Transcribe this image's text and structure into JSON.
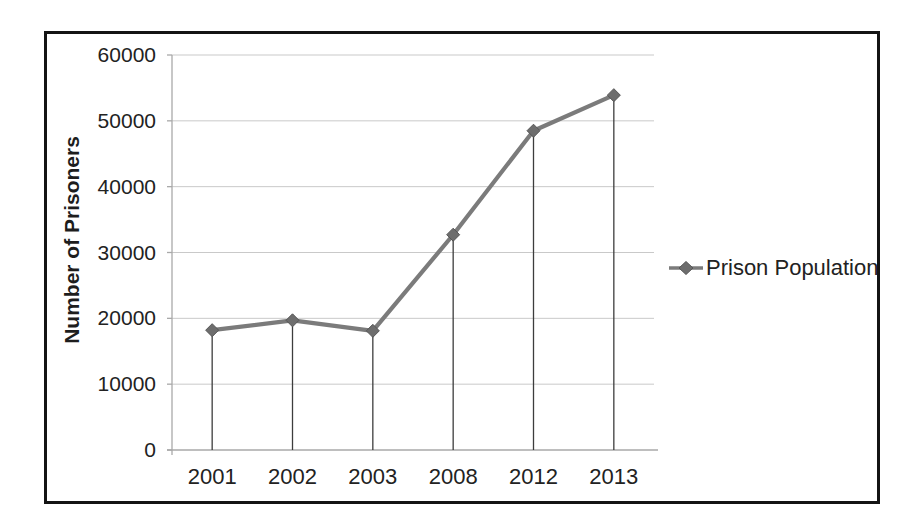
{
  "window": {
    "background": "#ffffff",
    "frame_border_color": "#141414",
    "text_color": "#222222"
  },
  "chart_data": {
    "type": "line",
    "title": "",
    "xlabel": "",
    "ylabel": "Number of Prisoners",
    "categories": [
      "2001",
      "2002",
      "2003",
      "2008",
      "2012",
      "2013"
    ],
    "series": [
      {
        "name": "Prison Population",
        "values": [
          18200,
          19700,
          18100,
          32700,
          48500,
          53900
        ],
        "color": "#7b7b7b",
        "marker": "diamond",
        "marker_color": "#6d6d6d",
        "marker_edge_color": "#565656"
      }
    ],
    "ylim": [
      0,
      60000
    ],
    "ytick_step": 10000,
    "yticks": [
      0,
      10000,
      20000,
      30000,
      40000,
      50000,
      60000
    ],
    "grid": "horizontal-major",
    "gridline_color": "#c9c9c9",
    "axis_color": "#a9a9a9",
    "drop_lines": true,
    "drop_line_color": "#3d3d3d",
    "legend_position": "right",
    "legend_entries": [
      "Prison Population"
    ]
  },
  "y_axis": {
    "title": "Number of Prisoners"
  },
  "legend": {
    "label": "Prison Population"
  }
}
